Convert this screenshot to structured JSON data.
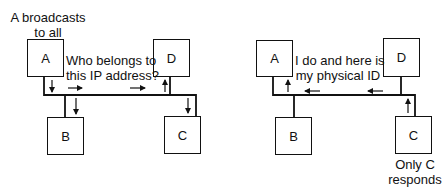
{
  "left_diagram": {
    "caption_top": [
      "A broadcasts",
      "to all"
    ],
    "message": [
      "Who belongs to",
      "this IP address?"
    ],
    "nodes": {
      "a": "A",
      "b": "B",
      "c": "C",
      "d": "D"
    }
  },
  "right_diagram": {
    "message": [
      "I do and here is",
      "my physical ID"
    ],
    "caption_bottom": [
      "Only C",
      "responds"
    ],
    "nodes": {
      "a": "A",
      "b": "B",
      "c": "C",
      "d": "D"
    }
  },
  "colors": {
    "line": "#111111",
    "background": "#ffffff"
  }
}
